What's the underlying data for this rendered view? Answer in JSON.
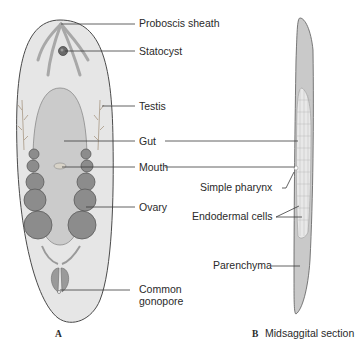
{
  "figure": {
    "panel_a": {
      "caption": "A",
      "labels": {
        "proboscis_sheath": "Proboscis sheath",
        "statocyst": "Statocyst",
        "testis": "Testis",
        "gut": "Gut",
        "mouth": "Mouth",
        "ovary": "Ovary",
        "common_gonopore_1": "Common",
        "common_gonopore_2": "gonopore"
      }
    },
    "panel_b": {
      "caption_letter": "B",
      "caption_text": "Midsaggital section",
      "labels": {
        "simple_pharynx": "Simple pharynx",
        "endodermal_cells": "Endodermal cells",
        "parenchyma": "Parenchyma"
      }
    },
    "colors": {
      "body_fill": "#e4e4e4",
      "body_outline": "#4a4a4a",
      "gut_fill": "#c9c9c9",
      "ovary_fill": "#8a8a8a",
      "section_fill": "#c8c8c8",
      "text": "#2a2a2a"
    }
  }
}
